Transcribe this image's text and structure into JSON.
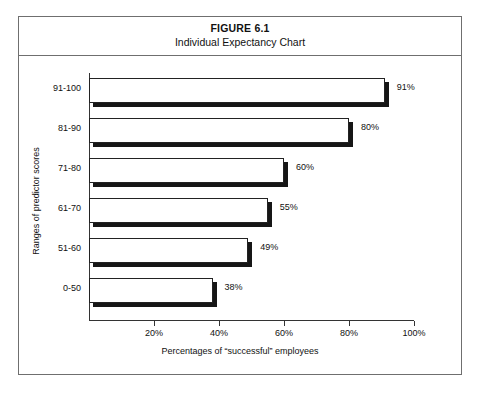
{
  "figure": {
    "number": "FIGURE 6.1",
    "subtitle": "Individual Expectancy Chart"
  },
  "chart_data": {
    "type": "bar",
    "orientation": "horizontal",
    "title": "Individual Expectancy Chart",
    "subtitle": "FIGURE 6.1",
    "xlabel": "Percentages of “successful” employees",
    "ylabel": "Ranges of predictor scores",
    "categories": [
      "0-50",
      "51-60",
      "61-70",
      "71-80",
      "81-90",
      "91-100"
    ],
    "values": [
      38,
      49,
      55,
      60,
      80,
      91
    ],
    "value_labels": [
      "38%",
      "49%",
      "55%",
      "60%",
      "80%",
      "91%"
    ],
    "xlim": [
      0,
      100
    ],
    "ylim": null,
    "xticks": [
      0,
      20,
      40,
      60,
      80,
      100
    ],
    "xtick_labels": [
      "",
      "20%",
      "40%",
      "60%",
      "80%",
      "100%"
    ],
    "grid": false,
    "legend": null,
    "bar_style": {
      "face_color": "#ffffff",
      "edge_color": "#222222",
      "shadow_color": "#161616"
    }
  },
  "axis": {
    "x_title": "Percentages of “successful” employees",
    "y_title": "Ranges of predictor scores",
    "ticks": [
      {
        "value": 0,
        "label": ""
      },
      {
        "value": 20,
        "label": "20%"
      },
      {
        "value": 40,
        "label": "40%"
      },
      {
        "value": 60,
        "label": "60%"
      },
      {
        "value": 80,
        "label": "80%"
      },
      {
        "value": 100,
        "label": "100%"
      }
    ]
  },
  "bars": [
    {
      "category": "91-100",
      "value": 91,
      "label": "91%"
    },
    {
      "category": "81-90",
      "value": 80,
      "label": "80%"
    },
    {
      "category": "71-80",
      "value": 60,
      "label": "60%"
    },
    {
      "category": "61-70",
      "value": 55,
      "label": "55%"
    },
    {
      "category": "51-60",
      "value": 49,
      "label": "49%"
    },
    {
      "category": "0-50",
      "value": 38,
      "label": "38%"
    }
  ]
}
